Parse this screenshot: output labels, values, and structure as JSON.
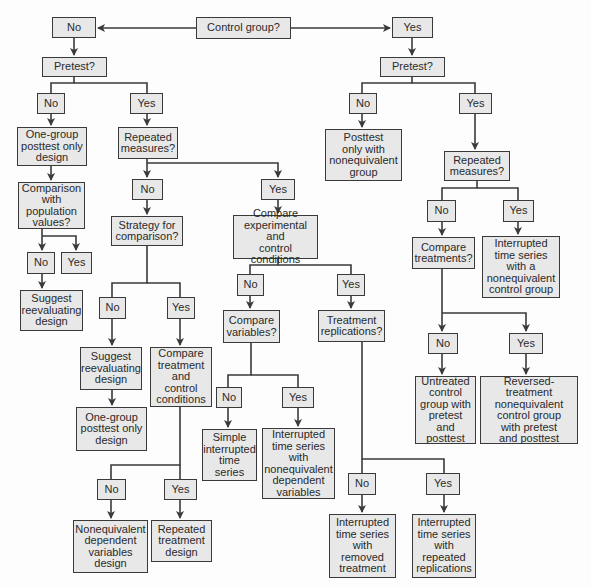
{
  "diagram": {
    "type": "decision-flowchart",
    "colors": {
      "box_fill": "#e8e8e8",
      "box_border": "#3a3a3a",
      "line": "#3a3a3a",
      "text": "#2a2a2a",
      "background": "#fdfdfd"
    },
    "nodes": {
      "control_group": "Control group?",
      "cg_no": "No",
      "cg_yes": "Yes",
      "pretest_left": "Pretest?",
      "pretest_right": "Pretest?",
      "ptl_no": "No",
      "ptl_yes": "Yes",
      "ptr_no": "No",
      "ptr_yes": "Yes",
      "one_group_posttest_top": "One-group\nposttest only\ndesign",
      "repeated_measures_left": "Repeated\nmeasures?",
      "posttest_noneq": "Posttest\nonly with\nnonequivalent\ngroup",
      "repeated_measures_right": "Repeated\nmeasures?",
      "comparison_population": "Comparison\nwith\npopulation\nvalues?",
      "rml_no": "No",
      "rml_yes": "Yes",
      "strategy_comparison": "Strategy for\ncomparison?",
      "compare_exp_control": "Compare\nexperimental and\ncontrol conditions",
      "cp_no": "No",
      "cp_yes": "Yes",
      "suggest_reevaluating_left": "Suggest\nreevaluating\ndesign",
      "rmr_no": "No",
      "rmr_yes": "Yes",
      "compare_treatments": "Compare\ntreatments?",
      "its_noneq_control": "Interrupted\ntime series\nwith a\nnonequivalent\ncontrol group",
      "sc_no": "No",
      "sc_yes": "Yes",
      "cec_no": "No",
      "cec_yes": "Yes",
      "compare_variables": "Compare\nvariables?",
      "treatment_replications": "Treatment\nreplications?",
      "suggest_reevaluating_mid": "Suggest\nreevaluating\ndesign",
      "compare_treatment_control": "Compare\ntreatment\nand\ncontrol\nconditions",
      "ct_no": "No",
      "ct_yes": "Yes",
      "one_group_posttest_mid": "One-group\nposttest only\ndesign",
      "cv_no": "No",
      "cv_yes": "Yes",
      "untreated_control": "Untreated\ncontrol\ngroup with\npretest and\nposttest",
      "reversed_treatment": "Reversed-treatment\nnonequivalent\ncontrol group\nwith pretest\nand posttest",
      "simple_its": "Simple\ninterrupted\ntime\nseries",
      "its_noneq_dep": "Interrupted\ntime series\nwith\nnonequivalent\ndependent\nvariables",
      "ctc_no": "No",
      "ctc_yes": "Yes",
      "tr_no": "No",
      "tr_yes": "Yes",
      "noneq_dep_var_design": "Nonequivalent\ndependent\nvariables\ndesign",
      "repeated_treatment_design": "Repeated\ntreatment\ndesign",
      "its_removed_treatment": "Interrupted\ntime series\nwith\nremoved\ntreatment",
      "its_repeated_replications": "Interrupted\ntime series\nwith\nrepeated\nreplications"
    }
  }
}
